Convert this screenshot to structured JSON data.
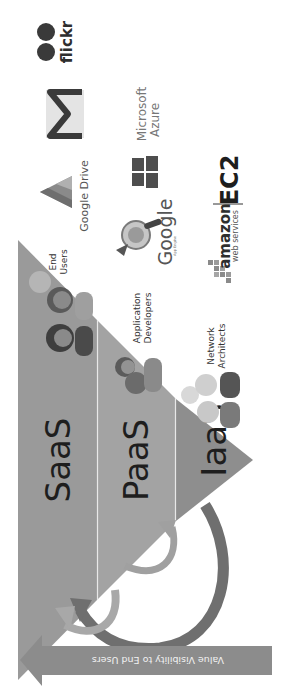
{
  "diagram": {
    "orientation": "rotated-90-clockwise",
    "colors": {
      "background": "#ffffff",
      "saas_fill": "#9a9a9a",
      "paas_fill": "#a3a3a3",
      "iaas_fill": "#8e8e8e",
      "layer_divider": "#e8e8e8",
      "value_arrow": "#8c8c8c",
      "curved_arrow_dark": "#6f6f6f",
      "curved_arrow_light": "#a8a8a8",
      "label_text": "#1e1e1e"
    },
    "layers": [
      {
        "id": "saas",
        "label": "SaaS",
        "role": {
          "line1": "End",
          "line2": "Users"
        }
      },
      {
        "id": "paas",
        "label": "PaaS",
        "role": {
          "line1": "Application",
          "line2": "Developers"
        }
      },
      {
        "id": "iaas",
        "label": "IaaS",
        "role": {
          "line1": "Network",
          "line2": "Architects"
        }
      }
    ],
    "providers": {
      "saas": [
        {
          "name": "flickr",
          "label": "flickr",
          "icon": "flickr-dots-icon"
        },
        {
          "name": "gmail",
          "label": "",
          "icon": "gmail-m-icon"
        },
        {
          "name": "google-drive",
          "label": "Google Drive",
          "icon": "google-drive-triangle-icon"
        }
      ],
      "paas": [
        {
          "name": "microsoft-azure",
          "label_line1": "Microsoft",
          "label_line2": "Azure",
          "icon": "windows-flag-icon"
        },
        {
          "name": "google-app-engine",
          "label": "Google",
          "sublabel": "App Engine",
          "icon": "app-engine-cup-icon"
        }
      ],
      "iaas": [
        {
          "name": "amazon-ec2",
          "label": "amazon",
          "sublabel": "web services",
          "product": "EC2",
          "icon": "aws-cubes-icon"
        }
      ]
    },
    "value_arrow": {
      "label": "Value Visibility to End Users",
      "direction": "toward-saas"
    }
  }
}
